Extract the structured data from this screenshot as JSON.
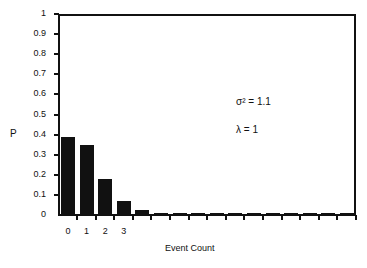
{
  "chart_data": {
    "type": "bar",
    "title": "",
    "xlabel": "Event Count",
    "ylabel": "P",
    "ylim": [
      0,
      1
    ],
    "yticks": [
      "0",
      "0.1",
      "0.2",
      "0.3",
      "0.4",
      "0.5",
      "0.6",
      "0.7",
      "0.8",
      "0.9",
      "1"
    ],
    "categories": [
      0,
      1,
      2,
      3,
      4,
      5,
      6,
      7,
      8,
      9,
      10,
      11,
      12,
      13,
      14,
      15
    ],
    "xtick_labels": [
      "0",
      "1",
      "2",
      "3"
    ],
    "values": [
      0.39,
      0.35,
      0.18,
      0.07,
      0.025,
      0.012,
      0.012,
      0.006,
      0.006,
      0.005,
      0.005,
      0.005,
      0.005,
      0.005,
      0.005,
      0.005
    ],
    "grid": false,
    "legend": null,
    "annotations": [
      "σ² = 1.1",
      "λ = 1"
    ],
    "bar_color": "#111111"
  },
  "annotations": {
    "variance": "σ² = 1.1",
    "lambda": "λ = 1"
  },
  "axes": {
    "xlabel": "Event Count",
    "ylabel": "P"
  }
}
